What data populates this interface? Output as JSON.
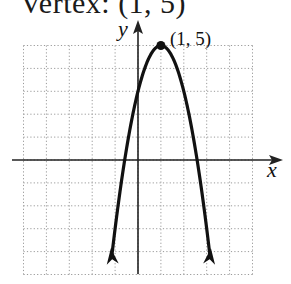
{
  "title": "Vertex: (1, 5)",
  "chart_data": {
    "type": "line",
    "title": "Vertex: (1, 5)",
    "function": "y = -2(x - 1)^2 + 5",
    "xlabel": "x",
    "ylabel": "y",
    "xlim": [
      -5,
      5
    ],
    "ylim": [
      -5,
      5
    ],
    "grid": true,
    "grid_style": "dotted",
    "series": [
      {
        "name": "parabola",
        "x": [
          -1.19,
          -1,
          -0.5,
          0,
          0.5,
          1,
          1.5,
          2,
          2.5,
          3,
          3.19
        ],
        "y": [
          -4.6,
          -3,
          0.5,
          3,
          4.5,
          5,
          4.5,
          3,
          0.5,
          -3,
          -4.6
        ]
      }
    ],
    "annotations": [
      {
        "text": "(1, 5)",
        "x": 1,
        "y": 5,
        "marker": "dot"
      }
    ],
    "arrows_on_ends": true
  },
  "labels": {
    "x_axis": "x",
    "y_axis": "y",
    "vertex": "(1, 5)"
  },
  "colors": {
    "curve": "#111111",
    "grid": "#9a9a9a",
    "axis": "#222222"
  }
}
